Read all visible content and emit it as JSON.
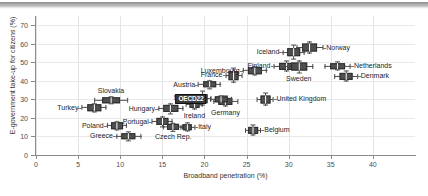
{
  "chart_data": {
    "type": "scatter",
    "title": "",
    "xlabel": "Broadband penetration (%)",
    "ylabel": "E-government take-up for citizens (%)",
    "xlim": [
      0,
      45
    ],
    "ylim": [
      0,
      75
    ],
    "xticks": [
      0,
      5,
      10,
      15,
      20,
      25,
      30,
      35,
      40
    ],
    "yticks": [
      0,
      10,
      20,
      30,
      40,
      50,
      60,
      70
    ],
    "grid": true,
    "legend": "none",
    "marker_style": "box-and-whisker cross (x and y ranges with central box)",
    "points": [
      {
        "name": "Turkey",
        "x": 6.9,
        "y": 25.5,
        "x_lo": 5.4,
        "x_hi": 8.4,
        "y_lo": 23.0,
        "y_hi": 28.0,
        "label_pos": "left"
      },
      {
        "name": "Slovakia",
        "x": 8.9,
        "y": 29.5,
        "x_lo": 7.0,
        "x_hi": 11.0,
        "y_lo": 27.5,
        "y_hi": 31.5,
        "label_pos": "top"
      },
      {
        "name": "Poland",
        "x": 9.6,
        "y": 15.8,
        "x_lo": 8.4,
        "x_hi": 10.8,
        "y_lo": 13.5,
        "y_hi": 18.5,
        "label_pos": "left"
      },
      {
        "name": "Greece",
        "x": 11.0,
        "y": 10.0,
        "x_lo": 9.5,
        "x_hi": 12.5,
        "y_lo": 7.5,
        "y_hi": 12.5,
        "label_pos": "left"
      },
      {
        "name": "Portugal",
        "x": 15.0,
        "y": 18.0,
        "x_lo": 13.8,
        "x_hi": 16.3,
        "y_lo": 15.0,
        "y_hi": 21.0,
        "label_pos": "left"
      },
      {
        "name": "Czech Rep.",
        "x": 16.3,
        "y": 15.0,
        "x_lo": 15.1,
        "x_hi": 17.5,
        "y_lo": 12.5,
        "y_hi": 17.0,
        "label_pos": "bottom"
      },
      {
        "name": "Hungary",
        "x": 16.0,
        "y": 25.0,
        "x_lo": 14.5,
        "x_hi": 17.5,
        "y_lo": 22.0,
        "y_hi": 28.0,
        "label_pos": "left"
      },
      {
        "name": "Italy",
        "x": 18.0,
        "y": 15.0,
        "x_lo": 17.2,
        "x_hi": 19.0,
        "y_lo": 12.5,
        "y_hi": 17.5,
        "label_pos": "right"
      },
      {
        "name": "Ireland",
        "x": 18.8,
        "y": 27.5,
        "x_lo": 17.8,
        "x_hi": 19.8,
        "y_lo": 24.5,
        "y_hi": 30.5,
        "label_pos": "bottom"
      },
      {
        "name": "Spain",
        "x": 19.8,
        "y": 30.5,
        "x_lo": 18.8,
        "x_hi": 20.8,
        "y_lo": 26.0,
        "y_hi": 34.0,
        "label_pos": "left"
      },
      {
        "name": "Austria",
        "x": 20.6,
        "y": 38.0,
        "x_lo": 19.3,
        "x_hi": 22.0,
        "y_lo": 35.5,
        "y_hi": 40.5,
        "label_pos": "left"
      },
      {
        "name": "Germany",
        "x": 22.5,
        "y": 29.0,
        "x_lo": 21.0,
        "x_hi": 24.0,
        "y_lo": 26.0,
        "y_hi": 32.0,
        "label_pos": "bottom"
      },
      {
        "name": "OECD22",
        "x": 22.0,
        "y": 30.0,
        "x_lo": 20.7,
        "x_hi": 23.3,
        "y_lo": 28.0,
        "y_hi": 32.0,
        "label_pos": "leftbox",
        "highlight": true
      },
      {
        "name": "France",
        "x": 23.5,
        "y": 43.0,
        "x_lo": 22.6,
        "x_hi": 24.6,
        "y_lo": 39.0,
        "y_hi": 47.0,
        "label_pos": "left"
      },
      {
        "name": "Belgium",
        "x": 25.8,
        "y": 13.5,
        "x_lo": 24.9,
        "x_hi": 26.8,
        "y_lo": 10.5,
        "y_hi": 16.5,
        "label_pos": "right"
      },
      {
        "name": "Luxembourg",
        "x": 26.0,
        "y": 45.5,
        "x_lo": 24.6,
        "x_hi": 27.5,
        "y_lo": 43.0,
        "y_hi": 48.0,
        "label_pos": "left"
      },
      {
        "name": "United Kingdom",
        "x": 27.2,
        "y": 30.0,
        "x_lo": 26.2,
        "x_hi": 28.2,
        "y_lo": 26.5,
        "y_hi": 33.5,
        "label_pos": "right"
      },
      {
        "name": "Finland",
        "x": 29.8,
        "y": 48.0,
        "x_lo": 28.2,
        "x_hi": 31.4,
        "y_lo": 45.0,
        "y_hi": 51.0,
        "label_pos": "left"
      },
      {
        "name": "Iceland",
        "x": 30.6,
        "y": 55.5,
        "x_lo": 29.3,
        "x_hi": 32.0,
        "y_lo": 51.0,
        "y_hi": 59.0,
        "label_pos": "left"
      },
      {
        "name": "Sweden",
        "x": 31.2,
        "y": 47.5,
        "x_lo": 29.5,
        "x_hi": 33.0,
        "y_lo": 44.0,
        "y_hi": 51.0,
        "label_pos": "bottom"
      },
      {
        "name": "Norway",
        "x": 32.5,
        "y": 58.0,
        "x_lo": 31.0,
        "x_hi": 34.2,
        "y_lo": 55.0,
        "y_hi": 62.0,
        "label_pos": "right"
      },
      {
        "name": "Netherlands",
        "x": 35.8,
        "y": 48.0,
        "x_lo": 34.2,
        "x_hi": 37.4,
        "y_lo": 45.5,
        "y_hi": 50.5,
        "label_pos": "right"
      },
      {
        "name": "Denmark",
        "x": 36.8,
        "y": 42.5,
        "x_lo": 35.4,
        "x_hi": 38.2,
        "y_lo": 39.5,
        "y_hi": 45.5,
        "label_pos": "right"
      }
    ]
  },
  "colors": {
    "marker": "#4f4f4f",
    "marker_edge": "#2d2d2d",
    "grid": "#e4e4e4",
    "axis": "#8a8a8a",
    "text": "#1d1d1d",
    "highlight_bg": "#3a3a3a",
    "highlight_text": "#ffffff"
  }
}
